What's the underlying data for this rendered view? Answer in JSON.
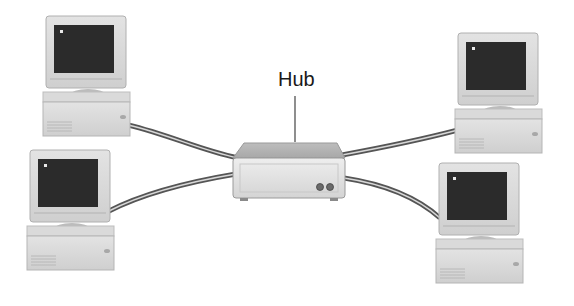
{
  "diagram": {
    "type": "star-network-topology",
    "hub": {
      "label": "Hub",
      "indicator_lights": 2
    },
    "nodes": [
      {
        "name": "computer-top-left",
        "position": "top-left"
      },
      {
        "name": "computer-bottom-left",
        "position": "bottom-left"
      },
      {
        "name": "computer-top-right",
        "position": "top-right"
      },
      {
        "name": "computer-bottom-right",
        "position": "bottom-right"
      }
    ],
    "connections": [
      {
        "from": "computer-top-left",
        "to": "hub"
      },
      {
        "from": "computer-bottom-left",
        "to": "hub"
      },
      {
        "from": "computer-top-right",
        "to": "hub"
      },
      {
        "from": "computer-bottom-right",
        "to": "hub"
      }
    ],
    "colors": {
      "background": "#ffffff",
      "case": "#d9d9d9",
      "case_shadow": "#b5b5b5",
      "screen": "#2b2b2b",
      "cable_outer": "#555555",
      "cable_inner": "#d8d8d8",
      "text": "#1a1a1a"
    }
  }
}
